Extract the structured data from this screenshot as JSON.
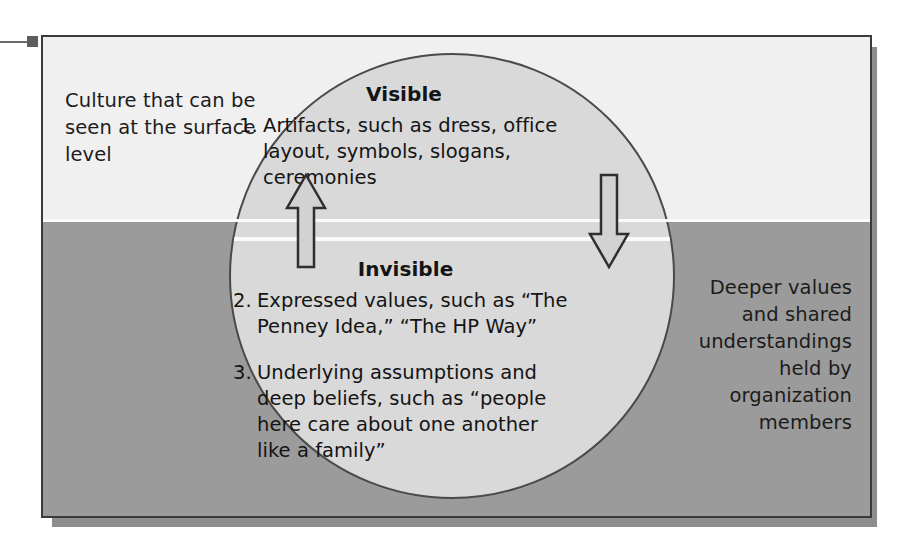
{
  "figure": {
    "left_caption": "Culture that can be seen at the surface level",
    "right_caption": "Deeper values and shared understandings held by organization members",
    "visible": {
      "heading": "Visible",
      "items": [
        {
          "number": "1.",
          "text": "Artifacts, such as dress, office layout, symbols, slogans, ceremonies"
        }
      ]
    },
    "invisible": {
      "heading": "Invisible",
      "items": [
        {
          "number": "2.",
          "text": "Expressed values, such as “The Penney Idea,” “The HP Way”"
        },
        {
          "number": "3.",
          "text": "Underlying assumptions and deep beliefs, such as “people here care about one another like a family”"
        }
      ]
    },
    "arrows": [
      {
        "name": "up-arrow",
        "direction": "up"
      },
      {
        "name": "down-arrow",
        "direction": "down"
      }
    ],
    "colors": {
      "surface_band": "#f0f0f0",
      "deep_band": "#9b9b9b",
      "circle_fill": "#d9d9d9",
      "waterline": "#fbfbfb",
      "outline": "#3a3a3a",
      "text": "#141414",
      "shadow": "#8d8d8d"
    }
  }
}
